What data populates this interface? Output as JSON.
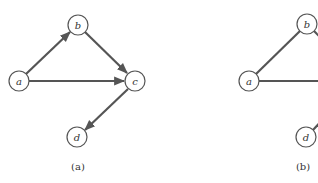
{
  "panels": [
    {
      "id": "a",
      "caption": "(a)",
      "directed": true,
      "nodes": [
        {
          "label": "a",
          "x": 19,
          "y": 81
        },
        {
          "label": "b",
          "x": 78,
          "y": 25
        },
        {
          "label": "c",
          "x": 135,
          "y": 81
        },
        {
          "label": "d",
          "x": 77,
          "y": 137
        }
      ],
      "edges": [
        {
          "from": "a",
          "to": "b"
        },
        {
          "from": "a",
          "to": "c"
        },
        {
          "from": "b",
          "to": "c"
        },
        {
          "from": "c",
          "to": "d"
        }
      ]
    },
    {
      "id": "b",
      "caption": "(b)",
      "directed": false,
      "nodes": [
        {
          "label": "a",
          "x": 249,
          "y": 81
        },
        {
          "label": "b",
          "x": 307,
          "y": 24
        },
        {
          "label": "d",
          "x": 306,
          "y": 137
        }
      ],
      "edges": [
        {
          "from": "a",
          "to": "b"
        },
        {
          "from": "a",
          "to": "c"
        },
        {
          "from": "b",
          "to": "c"
        },
        {
          "from": "c",
          "to": "d"
        }
      ]
    }
  ]
}
